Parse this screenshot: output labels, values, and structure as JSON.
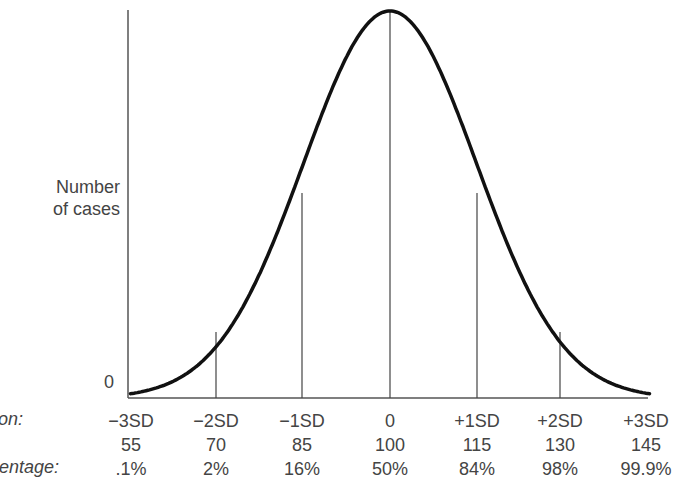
{
  "chart_data": {
    "type": "line",
    "title": "",
    "ylabel": "Number of cases",
    "y_zero_label": "0",
    "row_labels": [
      "...ion:",
      "",
      "...centage:"
    ],
    "categories": [
      "-3SD",
      "-2SD",
      "-1SD",
      "0",
      "+1SD",
      "+2SD",
      "+3SD"
    ],
    "scores": [
      "55",
      "70",
      "85",
      "100",
      "115",
      "130",
      "145"
    ],
    "percentages": [
      ".1%",
      "2%",
      "16%",
      "50%",
      "84%",
      "98%",
      "99.9%"
    ],
    "series": [
      {
        "name": "Normal distribution",
        "x_sd": [
          -3,
          -2,
          -1,
          0,
          1,
          2,
          3
        ],
        "relative_height": [
          0.011,
          0.135,
          0.607,
          1.0,
          0.607,
          0.135,
          0.011
        ]
      }
    ],
    "vertical_markers_at_sd": [
      -2,
      -1,
      0,
      1,
      2
    ],
    "grid": false,
    "legend": "none"
  },
  "labels": {
    "ylabel_line1": "Number",
    "ylabel_line2": "of cases",
    "zero": "0",
    "row1": "ion:",
    "row3": "centage:"
  },
  "columns": [
    {
      "sd": "−3SD",
      "score": "55",
      "pct": ".1%"
    },
    {
      "sd": "−2SD",
      "score": "70",
      "pct": "2%"
    },
    {
      "sd": "−1SD",
      "score": "85",
      "pct": "16%"
    },
    {
      "sd": "0",
      "score": "100",
      "pct": "50%"
    },
    {
      "sd": "+1SD",
      "score": "115",
      "pct": "84%"
    },
    {
      "sd": "+2SD",
      "score": "130",
      "pct": "98%"
    },
    {
      "sd": "+3SD",
      "score": "145",
      "pct": "99.9%"
    }
  ]
}
